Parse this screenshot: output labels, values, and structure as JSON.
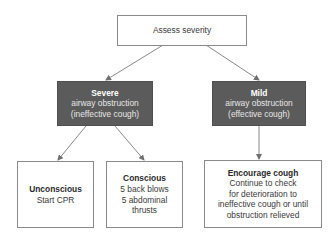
{
  "diagram": {
    "root": {
      "text": "Assess severity"
    },
    "severe": {
      "title": "Severe",
      "lines": [
        "airway obstruction",
        "(ineffective cough)"
      ]
    },
    "mild": {
      "title": "Mild",
      "lines": [
        "airway obstruction",
        "(effective cough)"
      ]
    },
    "unconscious": {
      "title": "Unconscious",
      "lines": [
        "Start CPR"
      ]
    },
    "conscious": {
      "title": "Conscious",
      "lines": [
        "5 back blows",
        "5 abdominal",
        "thrusts"
      ]
    },
    "encourage": {
      "title": "Encourage cough",
      "lines": [
        "Continue to check",
        "for deterioration to",
        "ineffective cough or until",
        "obstruction relieved"
      ]
    },
    "colors": {
      "dark_box": "#5b5b5b",
      "border": "#8a8a8a",
      "arrow": "#6f6f6f"
    },
    "edges": [
      {
        "from": "root",
        "to": "severe"
      },
      {
        "from": "root",
        "to": "mild"
      },
      {
        "from": "severe",
        "to": "unconscious"
      },
      {
        "from": "severe",
        "to": "conscious"
      },
      {
        "from": "mild",
        "to": "encourage"
      }
    ]
  }
}
